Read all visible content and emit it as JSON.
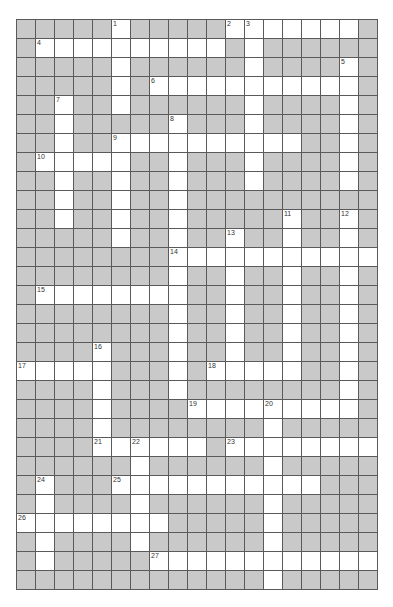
{
  "puzzle": {
    "rows": 30,
    "cols": 19,
    "colors": {
      "block": "#c9c9c9",
      "open": "#ffffff",
      "grid_line": "#5a5a5a",
      "number": "#333333"
    },
    "open_cells": [
      [
        5,
        11,
        12,
        13,
        14,
        15,
        16,
        17
      ],
      [
        1,
        2,
        3,
        4,
        5,
        6,
        7,
        8,
        9,
        10,
        12
      ],
      [
        5,
        12,
        17
      ],
      [
        5,
        7,
        8,
        9,
        10,
        11,
        12,
        13,
        14,
        15,
        16,
        17
      ],
      [
        2,
        5,
        12,
        17
      ],
      [
        2,
        8,
        12,
        17
      ],
      [
        2,
        5,
        6,
        7,
        8,
        9,
        10,
        11,
        12,
        13,
        14,
        17
      ],
      [
        1,
        2,
        3,
        4,
        5,
        8,
        12,
        17
      ],
      [
        2,
        5,
        8,
        12,
        17
      ],
      [
        2,
        5,
        8
      ],
      [
        2,
        5,
        8,
        14,
        17
      ],
      [
        5,
        8,
        11,
        14,
        17
      ],
      [
        8,
        9,
        10,
        11,
        12,
        13,
        14,
        15,
        16,
        17,
        18
      ],
      [
        8,
        11,
        14,
        17
      ],
      [
        1,
        2,
        3,
        4,
        5,
        6,
        7,
        8,
        11,
        14,
        17
      ],
      [
        8,
        11,
        14,
        17
      ],
      [
        8,
        11,
        14,
        17
      ],
      [
        4,
        8,
        11,
        14,
        17
      ],
      [
        0,
        1,
        2,
        3,
        4,
        8,
        10,
        11,
        12,
        13,
        14,
        17
      ],
      [
        4,
        8,
        17
      ],
      [
        4,
        9,
        10,
        11,
        12,
        13,
        14,
        15,
        16,
        17
      ],
      [
        4,
        13
      ],
      [
        4,
        5,
        6,
        7,
        8,
        9,
        11,
        12,
        13,
        14,
        15,
        16,
        17,
        18
      ],
      [
        6,
        13
      ],
      [
        1,
        5,
        6,
        7,
        8,
        9,
        10,
        11,
        12,
        13,
        14,
        15
      ],
      [
        1,
        6,
        13
      ],
      [
        0,
        1,
        2,
        3,
        4,
        5,
        6,
        7,
        13
      ],
      [
        1,
        6,
        13
      ],
      [
        1,
        7,
        8,
        9,
        10,
        11,
        12,
        13,
        14,
        15,
        16,
        17,
        18
      ],
      [
        13
      ]
    ],
    "clue_numbers": [
      {
        "label": "1",
        "row": 0,
        "col": 5
      },
      {
        "label": "2",
        "row": 0,
        "col": 11
      },
      {
        "label": "3",
        "row": 0,
        "col": 12
      },
      {
        "label": "4",
        "row": 1,
        "col": 1
      },
      {
        "label": "5",
        "row": 2,
        "col": 17
      },
      {
        "label": "6",
        "row": 3,
        "col": 7
      },
      {
        "label": "7",
        "row": 4,
        "col": 2
      },
      {
        "label": "8",
        "row": 5,
        "col": 8
      },
      {
        "label": "9",
        "row": 6,
        "col": 5
      },
      {
        "label": "10",
        "row": 7,
        "col": 1
      },
      {
        "label": "11",
        "row": 10,
        "col": 14
      },
      {
        "label": "12",
        "row": 10,
        "col": 17
      },
      {
        "label": "13",
        "row": 11,
        "col": 11
      },
      {
        "label": "14",
        "row": 12,
        "col": 8
      },
      {
        "label": "15",
        "row": 14,
        "col": 1
      },
      {
        "label": "16",
        "row": 17,
        "col": 4
      },
      {
        "label": "17",
        "row": 18,
        "col": 0
      },
      {
        "label": "18",
        "row": 18,
        "col": 10
      },
      {
        "label": "19",
        "row": 20,
        "col": 9
      },
      {
        "label": "20",
        "row": 20,
        "col": 13
      },
      {
        "label": "21",
        "row": 22,
        "col": 4
      },
      {
        "label": "22",
        "row": 22,
        "col": 6
      },
      {
        "label": "23",
        "row": 22,
        "col": 11
      },
      {
        "label": "24",
        "row": 24,
        "col": 1
      },
      {
        "label": "25",
        "row": 24,
        "col": 5
      },
      {
        "label": "26",
        "row": 26,
        "col": 0
      },
      {
        "label": "27",
        "row": 28,
        "col": 7
      }
    ]
  }
}
